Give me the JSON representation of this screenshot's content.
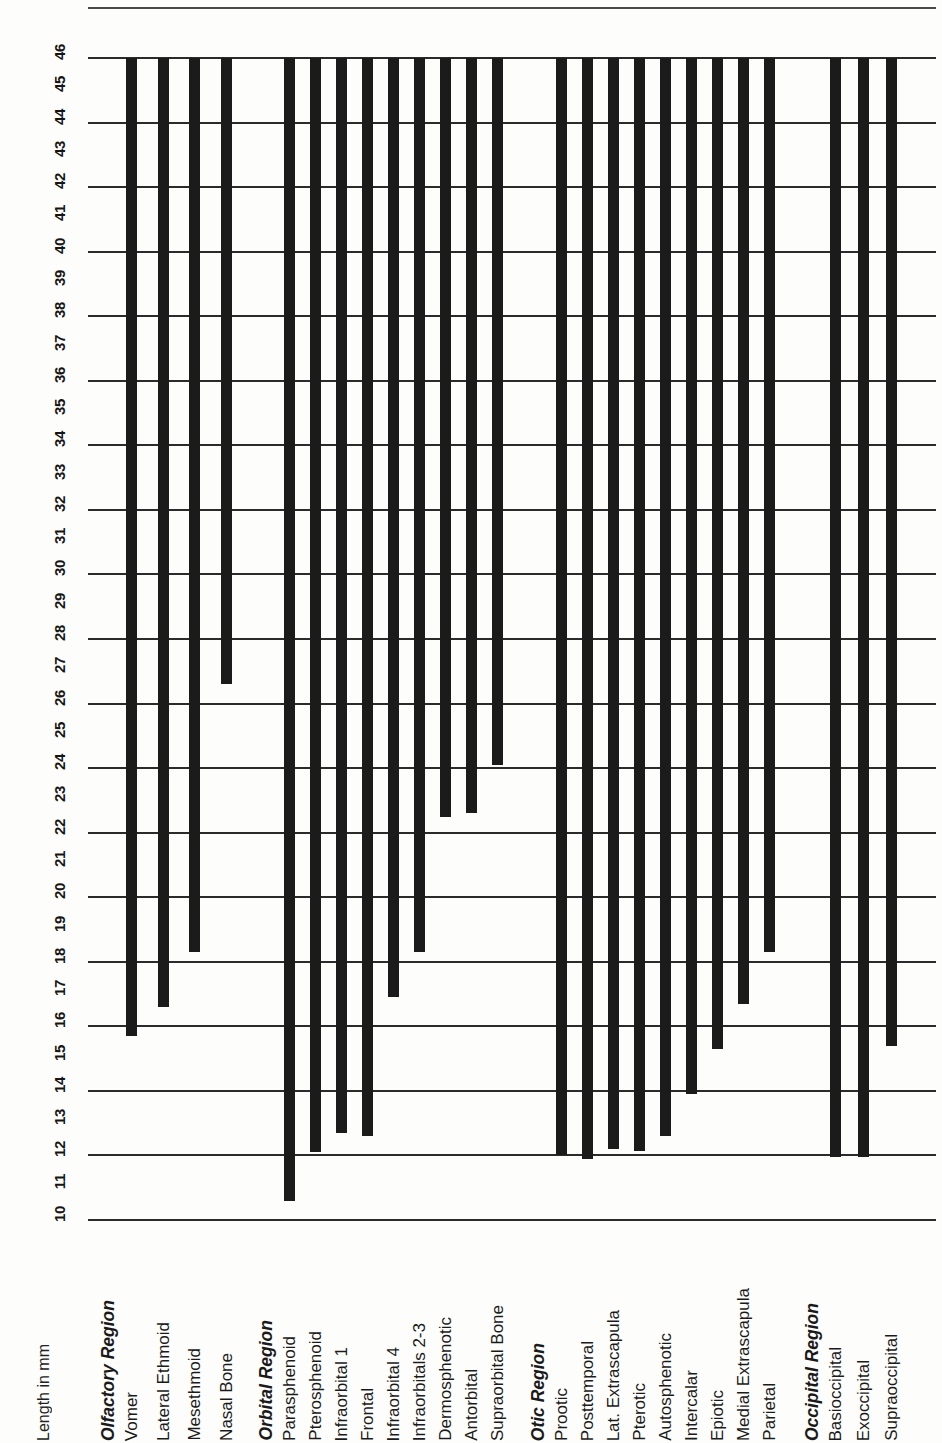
{
  "chart_data": {
    "type": "bar",
    "orientation": "vertical-bars-with-rotated-labels",
    "title": "",
    "xlabel": "",
    "ylabel": "Length in mm",
    "ylim": [
      10,
      46
    ],
    "ytick_step": 1,
    "gridline_step": 2,
    "grid": true,
    "legend": null,
    "bar_top_value": 46,
    "ytick_labels": [
      "10",
      "11",
      "12",
      "13",
      "14",
      "15",
      "16",
      "17",
      "18",
      "19",
      "20",
      "21",
      "22",
      "23",
      "24",
      "25",
      "26",
      "27",
      "28",
      "29",
      "30",
      "31",
      "32",
      "33",
      "34",
      "35",
      "36",
      "37",
      "38",
      "39",
      "40",
      "41",
      "42",
      "43",
      "44",
      "45",
      "46"
    ],
    "gridline_values": [
      10,
      12,
      14,
      16,
      18,
      20,
      22,
      24,
      26,
      28,
      30,
      32,
      34,
      36,
      38,
      40,
      42,
      44,
      46
    ],
    "groups": [
      {
        "name": "Olfactory Region",
        "categories": [
          "Vomer",
          "Lateral Ethmoid",
          "Mesethmoid",
          "Nasal Bone"
        ],
        "values": [
          15.7,
          16.6,
          18.3,
          26.6
        ]
      },
      {
        "name": "Orbital Region",
        "categories": [
          "Parasphenoid",
          "Pterosphenoid",
          "Infraorbital 1",
          "Frontal",
          "Infraorbital 4",
          "Infraorbitals 2-3",
          "Dermosphenotic",
          "Antorbital",
          "Supraorbital Bone"
        ],
        "values": [
          10.6,
          12.1,
          12.7,
          12.6,
          16.9,
          18.3,
          22.5,
          22.6,
          24.1
        ]
      },
      {
        "name": "Otic Region",
        "categories": [
          "Prootic",
          "Posttemporal",
          "Lat. Extrascapula",
          "Pterotic",
          "Autosphenotic",
          "Intercalar",
          "Epiotic",
          "Medial Extrascapula",
          "Parietal"
        ],
        "values": [
          12.0,
          11.9,
          12.2,
          12.15,
          12.6,
          13.9,
          15.3,
          16.7,
          18.3
        ]
      },
      {
        "name": "Occipital Region",
        "categories": [
          "Basioccipital",
          "Exoccipital",
          "Supraoccipital"
        ],
        "values": [
          11.95,
          11.95,
          15.4
        ]
      }
    ],
    "flat_categories": [
      "Vomer",
      "Lateral Ethmoid",
      "Mesethmoid",
      "Nasal Bone",
      "Parasphenoid",
      "Pterosphenoid",
      "Infraorbital 1",
      "Frontal",
      "Infraorbital 4",
      "Infraorbitals 2-3",
      "Dermosphenotic",
      "Antorbital",
      "Supraorbital Bone",
      "Prootic",
      "Posttemporal",
      "Lat. Extrascapula",
      "Pterotic",
      "Autosphenotic",
      "Intercalar",
      "Epiotic",
      "Medial Extrascapula",
      "Parietal",
      "Basioccipital",
      "Exoccipital",
      "Supraoccipital"
    ],
    "flat_values": [
      15.7,
      16.6,
      18.3,
      26.6,
      10.6,
      12.1,
      12.7,
      12.6,
      16.9,
      18.3,
      22.5,
      22.6,
      24.1,
      12.0,
      11.9,
      12.2,
      12.15,
      12.6,
      13.9,
      15.3,
      16.7,
      18.3,
      11.95,
      11.95,
      15.4
    ],
    "bar_color": "#1b1b1b",
    "grid_color": "#2b2b2b",
    "background_color": "#fdfdfb"
  },
  "labels": {
    "axis_title": "Length in mm"
  }
}
